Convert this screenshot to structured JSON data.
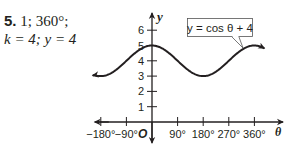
{
  "answer": {
    "number": "5.",
    "line1": "1; 360°;",
    "line2": "k = 4; y = 4"
  },
  "chart_data": {
    "type": "line",
    "title": "",
    "equation_label": "y = cos θ + 4",
    "xlabel": "θ",
    "ylabel": "y",
    "origin_label": "O",
    "x_ticks": [
      "−180°",
      "−90°",
      "90°",
      "180°",
      "270°",
      "360°"
    ],
    "x_tick_values": [
      -180,
      -90,
      90,
      180,
      270,
      360
    ],
    "y_ticks": [
      "1",
      "2",
      "3",
      "4",
      "5",
      "6"
    ],
    "y_tick_values": [
      1,
      2,
      3,
      4,
      5,
      6
    ],
    "xlim": [
      -205,
      395
    ],
    "ylim": [
      0,
      6.5
    ],
    "series": [
      {
        "name": "y = cos θ + 4",
        "x": [
          -180,
          -90,
          0,
          90,
          180,
          270,
          360
        ],
        "values": [
          3,
          4,
          5,
          4,
          3,
          4,
          5
        ]
      }
    ],
    "grid": false,
    "colors": {
      "ink": "#231f20"
    }
  }
}
